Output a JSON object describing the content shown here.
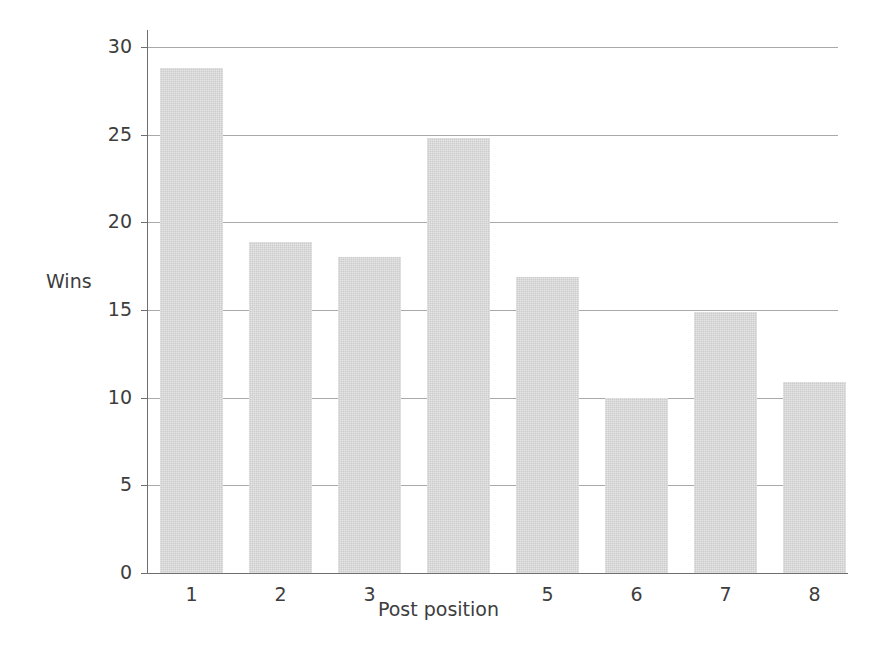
{
  "chart_data": {
    "type": "bar",
    "title": "",
    "subtitle": "",
    "xlabel": "Post position",
    "ylabel": "Wins",
    "categories": [
      "1",
      "2",
      "3",
      "",
      "5",
      "6",
      "7",
      "8"
    ],
    "category_note": "The tick label for post position 4 is blank in the source image",
    "values": [
      28.8,
      18.9,
      18.0,
      24.8,
      16.9,
      10.0,
      14.9,
      10.9
    ],
    "ylim": [
      0,
      30
    ],
    "yticks": [
      0,
      5,
      10,
      15,
      20,
      25,
      30
    ],
    "ytick_labels": [
      "0",
      "5",
      "10",
      "15",
      "20",
      "25",
      "30"
    ],
    "xlim_categories": 8,
    "grid": "horizontal",
    "legend": "none",
    "bar_color": "#cccccc",
    "bar_edge_color": "none",
    "axis_color": "#6f6f6f",
    "gridline_color": "#9a9a9a",
    "background_color": "#ffffff",
    "text_color": "#3d3d3d",
    "annotations": []
  },
  "figure": {
    "width": 877,
    "height": 658
  }
}
